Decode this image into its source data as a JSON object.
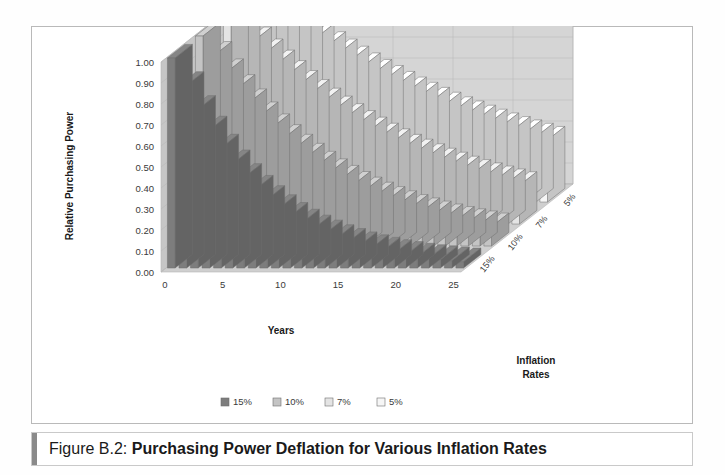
{
  "caption": {
    "label": "Figure B.2: ",
    "title": "Purchasing Power Deflation for Various Inflation Rates"
  },
  "colors": {
    "wall_back": "#d5d5d5",
    "wall_side": "#c6c6c6",
    "floor": "#cfcfcf",
    "grid": "#b6b6b6",
    "outline": "#6e6e6e",
    "series_15": "#7d7d7d",
    "series_10": "#c4c4c4",
    "series_7": "#e4e4e4",
    "series_5": "#f6f6f6",
    "text": "#3a3a3a"
  },
  "legend": {
    "items": [
      {
        "label": "15%",
        "color": "#7d7d7d"
      },
      {
        "label": "10%",
        "color": "#c4c4c4"
      },
      {
        "label": "7%",
        "color": "#e4e4e4"
      },
      {
        "label": "5%",
        "color": "#f6f6f6"
      }
    ]
  },
  "chart_data": {
    "type": "bar",
    "subtype": "3d-grouped-bar",
    "title": "Purchasing Power Deflation for Various Inflation Rates",
    "xlabel": "Years",
    "ylabel": "Relative Purchasing Power",
    "zlabel": "Inflation Rates",
    "ylim": [
      0.0,
      1.0
    ],
    "ytick_labels": [
      "1.00",
      "0.90",
      "0.80",
      "0.70",
      "0.60",
      "0.50",
      "0.40",
      "0.30",
      "0.20",
      "0.10",
      "0.00"
    ],
    "ytick_values": [
      1.0,
      0.9,
      0.8,
      0.7,
      0.6,
      0.5,
      0.4,
      0.3,
      0.2,
      0.1,
      0.0
    ],
    "grid": true,
    "legend_position": "bottom",
    "x": [
      0,
      1,
      2,
      3,
      4,
      5,
      6,
      7,
      8,
      9,
      10,
      11,
      12,
      13,
      14,
      15,
      16,
      17,
      18,
      19,
      20,
      21,
      22,
      23,
      24,
      25
    ],
    "xtick_labels": [
      "0",
      "5",
      "10",
      "15",
      "20",
      "25"
    ],
    "xtick_values": [
      0,
      5,
      10,
      15,
      20,
      25
    ],
    "z_categories": [
      "15%",
      "10%",
      "7%",
      "5%"
    ],
    "series": [
      {
        "name": "15%",
        "rate": 0.15,
        "color": "#7d7d7d",
        "values": [
          1.0,
          0.87,
          0.756,
          0.658,
          0.572,
          0.497,
          0.432,
          0.376,
          0.327,
          0.284,
          0.247,
          0.215,
          0.187,
          0.163,
          0.141,
          0.123,
          0.107,
          0.093,
          0.081,
          0.07,
          0.061,
          0.053,
          0.046,
          0.04,
          0.035,
          0.03
        ]
      },
      {
        "name": "10%",
        "rate": 0.1,
        "color": "#c4c4c4",
        "values": [
          1.0,
          0.909,
          0.826,
          0.751,
          0.683,
          0.621,
          0.564,
          0.513,
          0.467,
          0.424,
          0.386,
          0.35,
          0.319,
          0.29,
          0.263,
          0.239,
          0.218,
          0.198,
          0.18,
          0.164,
          0.149,
          0.135,
          0.123,
          0.112,
          0.102,
          0.092
        ]
      },
      {
        "name": "7%",
        "rate": 0.07,
        "color": "#e4e4e4",
        "values": [
          1.0,
          0.935,
          0.873,
          0.816,
          0.763,
          0.713,
          0.666,
          0.623,
          0.582,
          0.544,
          0.508,
          0.475,
          0.444,
          0.415,
          0.388,
          0.362,
          0.339,
          0.317,
          0.296,
          0.277,
          0.258,
          0.242,
          0.226,
          0.211,
          0.197,
          0.184
        ]
      },
      {
        "name": "5%",
        "rate": 0.05,
        "color": "#f6f6f6",
        "values": [
          1.0,
          0.952,
          0.907,
          0.864,
          0.823,
          0.784,
          0.746,
          0.711,
          0.677,
          0.645,
          0.614,
          0.585,
          0.557,
          0.53,
          0.505,
          0.481,
          0.458,
          0.436,
          0.416,
          0.396,
          0.377,
          0.359,
          0.342,
          0.326,
          0.31,
          0.295
        ]
      }
    ]
  }
}
